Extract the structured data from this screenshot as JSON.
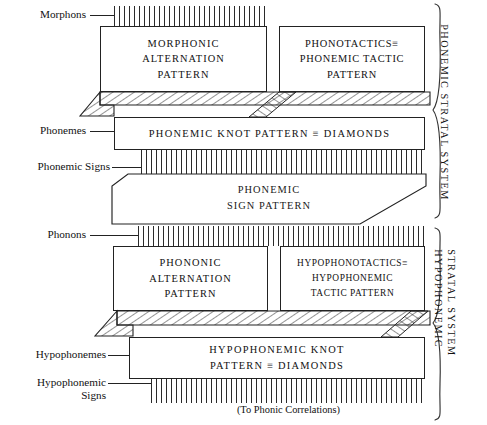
{
  "diagram": {
    "footnote": "(To Phonic Correlations)"
  },
  "left_labels": [
    {
      "id": "morphons",
      "text": "Morphons"
    },
    {
      "id": "phonemes",
      "text": "Phonemes"
    },
    {
      "id": "phonemic-signs",
      "text": "Phonemic Signs"
    },
    {
      "id": "phonons",
      "text": "Phonons"
    },
    {
      "id": "hypophonemes",
      "text": "Hypophonemes"
    },
    {
      "id": "hypophonemic-signs",
      "text": "Hypophonemic\nSigns"
    }
  ],
  "boxes": {
    "morphonic_alternation": {
      "line1": "MORPHONIC",
      "line2": "ALTERNATION",
      "line3": "PATTERN"
    },
    "phonotactics": {
      "line1": "PHONOTACTICS≡",
      "line2": "PHONEMIC TACTIC",
      "line3": "PATTERN"
    },
    "phonemic_knot": {
      "line1": "PHONEMIC KNOT PATTERN ≡ DIAMONDS"
    },
    "phonemic_sign": {
      "line1": "PHONEMIC",
      "line2": "SIGN PATTERN"
    },
    "phononic_alternation": {
      "line1": "PHONONIC",
      "line2": "ALTERNATION",
      "line3": "PATTERN"
    },
    "hypophonotactics": {
      "line1": "HYPOPHONOTACTICS≡",
      "line2": "HYPOPHONEMIC",
      "line3": "TACTIC PATTERN"
    },
    "hypophonemic_knot": {
      "line1": "HYPOPHONEMIC KNOT",
      "line2": "PATTERN ≡ DIAMONDS"
    }
  },
  "systems": [
    {
      "id": "phonemic-stratal-system",
      "line1": "PHONEMIC",
      "line2": "STRATAL SYSTEM"
    },
    {
      "id": "hypophonemic-stratal-system",
      "line1": "HYPOPHONEMIC",
      "line2": "STRATAL SYSTEM"
    }
  ],
  "colors": {
    "ink": "#222222",
    "background": "#ffffff"
  }
}
